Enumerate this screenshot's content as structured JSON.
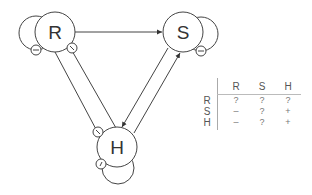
{
  "diagram": {
    "nodes": [
      {
        "id": "R",
        "label": "R"
      },
      {
        "id": "S",
        "label": "S"
      },
      {
        "id": "H",
        "label": "H"
      }
    ],
    "edges": [
      {
        "from": "R",
        "to": "S",
        "type": "arrow"
      },
      {
        "from": "R",
        "to": "H",
        "type": "inhibition-double"
      },
      {
        "from": "S",
        "to": "H",
        "type": "arrow"
      },
      {
        "from": "H",
        "to": "S",
        "type": "arrow"
      }
    ],
    "self_loops": [
      {
        "node": "R",
        "sign": "-"
      },
      {
        "node": "S",
        "sign": "-"
      },
      {
        "node": "H",
        "sign": "/"
      }
    ],
    "edge_markers": {
      "R_to_H_top": "\\",
      "R_to_H_bottom": "\\"
    }
  },
  "table": {
    "columns": [
      "R",
      "S",
      "H"
    ],
    "rows": [
      {
        "label": "R",
        "cells": [
          "?",
          "?",
          "?"
        ]
      },
      {
        "label": "S",
        "cells": [
          "–",
          "?",
          "+"
        ]
      },
      {
        "label": "H",
        "cells": [
          "–",
          "?",
          "+"
        ]
      }
    ]
  }
}
